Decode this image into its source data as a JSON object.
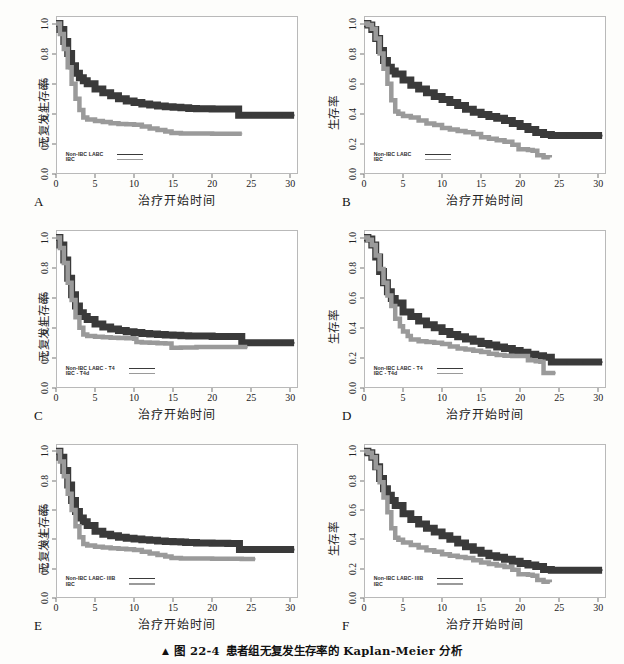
{
  "caption": {
    "marker": "▲",
    "figure_number": "图 22-4",
    "text": "患者组无复发生存率的 Kaplan-Meier 分析"
  },
  "axes": {
    "xlabel": "治疗开始时间",
    "ylabel_rfs": "无复发生存率",
    "ylabel_os": "生存率",
    "xticks": [
      "0",
      "5",
      "10",
      "15",
      "20",
      "25",
      "30"
    ],
    "yticks": [
      "0.0",
      "0.2",
      "0.4",
      "0.6",
      "0.8",
      "1.0"
    ],
    "xlim": [
      0,
      31
    ],
    "ylim": [
      0,
      1.05
    ]
  },
  "colors": {
    "series_dark": "#3a3a3a",
    "series_light": "#9a9a9a",
    "axis": "#b9b9b9",
    "background": "#ffffff",
    "page": "#fdfdfb"
  },
  "chart_data": [
    {
      "type": "line",
      "panel": "A",
      "title": "",
      "xlabel": "治疗开始时间",
      "ylabel": "无复发生存率",
      "xlim": [
        0,
        31
      ],
      "ylim": [
        0,
        1.05
      ],
      "grid": false,
      "legend_position": "bottom-left",
      "series": [
        {
          "name": "Non-IBC LABC",
          "style": "dark",
          "x": [
            0,
            0.5,
            1,
            1.5,
            2,
            2.5,
            3,
            3.5,
            4,
            5,
            6,
            7,
            8,
            9,
            10,
            11,
            12,
            13,
            14,
            15,
            16,
            17,
            18,
            19,
            20,
            21,
            22,
            23,
            23.4,
            25,
            27,
            29,
            30.5
          ],
          "y": [
            1.0,
            0.96,
            0.88,
            0.8,
            0.72,
            0.67,
            0.64,
            0.62,
            0.6,
            0.565,
            0.54,
            0.52,
            0.5,
            0.485,
            0.475,
            0.465,
            0.458,
            0.452,
            0.447,
            0.443,
            0.44,
            0.436,
            0.434,
            0.433,
            0.432,
            0.432,
            0.432,
            0.432,
            0.39,
            0.39,
            0.39,
            0.39,
            0.39
          ]
        },
        {
          "name": "IBC",
          "style": "light",
          "x": [
            0,
            0.5,
            1,
            1.5,
            2,
            2.5,
            3,
            3.5,
            4,
            5,
            6,
            7,
            8,
            9,
            10,
            11,
            12,
            13,
            14,
            14.8,
            16,
            18,
            20,
            22,
            23.8
          ],
          "y": [
            1.0,
            0.93,
            0.83,
            0.71,
            0.6,
            0.5,
            0.425,
            0.375,
            0.362,
            0.352,
            0.345,
            0.338,
            0.333,
            0.33,
            0.327,
            0.315,
            0.302,
            0.292,
            0.282,
            0.272,
            0.27,
            0.269,
            0.268,
            0.268,
            0.268
          ]
        }
      ],
      "legend": [
        "Non-IBC LABC",
        "IBC"
      ]
    },
    {
      "type": "line",
      "panel": "B",
      "title": "",
      "xlabel": "治疗开始时间",
      "ylabel": "生存率",
      "xlim": [
        0,
        31
      ],
      "ylim": [
        0,
        1.05
      ],
      "grid": false,
      "legend_position": "bottom-left",
      "series": [
        {
          "name": "Non-IBC LABC",
          "style": "dark",
          "x": [
            0,
            0.5,
            1,
            1.5,
            2,
            2.5,
            3,
            3.5,
            4,
            5,
            6,
            7,
            8,
            9,
            10,
            11,
            12,
            13,
            14,
            15,
            16,
            17,
            18,
            19,
            20,
            21,
            22,
            23,
            24,
            26,
            28,
            30.5
          ],
          "y": [
            1.0,
            0.99,
            0.96,
            0.9,
            0.82,
            0.755,
            0.71,
            0.685,
            0.665,
            0.625,
            0.59,
            0.565,
            0.54,
            0.515,
            0.495,
            0.475,
            0.455,
            0.43,
            0.41,
            0.395,
            0.382,
            0.37,
            0.355,
            0.335,
            0.315,
            0.295,
            0.275,
            0.262,
            0.255,
            0.255,
            0.255,
            0.255
          ]
        },
        {
          "name": "IBC",
          "style": "light",
          "x": [
            0,
            0.5,
            1,
            1.5,
            2,
            2.5,
            3,
            3.5,
            4,
            4.4,
            5,
            6,
            7,
            8,
            9,
            10,
            11,
            12,
            13,
            14,
            15,
            16,
            17,
            18,
            19,
            19.8,
            21,
            21.6,
            22.2,
            23,
            23.8
          ],
          "y": [
            1.0,
            0.99,
            0.965,
            0.9,
            0.8,
            0.7,
            0.6,
            0.49,
            0.415,
            0.4,
            0.385,
            0.375,
            0.355,
            0.335,
            0.325,
            0.305,
            0.295,
            0.285,
            0.278,
            0.265,
            0.245,
            0.235,
            0.225,
            0.215,
            0.195,
            0.165,
            0.16,
            0.155,
            0.125,
            0.112,
            0.11
          ]
        }
      ],
      "legend": [
        "Non-IBC LABC",
        "IBC"
      ]
    },
    {
      "type": "line",
      "panel": "C",
      "title": "",
      "xlabel": "治疗开始时间",
      "ylabel": "无复发生存率",
      "xlim": [
        0,
        31
      ],
      "ylim": [
        0,
        1.05
      ],
      "grid": false,
      "legend_position": "bottom-left",
      "series": [
        {
          "name": "Non-IBC LABC - T4",
          "style": "dark",
          "x": [
            0,
            0.5,
            1,
            1.5,
            2,
            2.5,
            3,
            3.5,
            4,
            5,
            6,
            7,
            8,
            9,
            10,
            11,
            12,
            13,
            14,
            15,
            16,
            17,
            18,
            20,
            22,
            23.8,
            25,
            27,
            29,
            30.5
          ],
          "y": [
            1.0,
            0.95,
            0.85,
            0.73,
            0.62,
            0.545,
            0.5,
            0.475,
            0.455,
            0.425,
            0.405,
            0.392,
            0.382,
            0.374,
            0.368,
            0.363,
            0.358,
            0.355,
            0.352,
            0.35,
            0.348,
            0.346,
            0.345,
            0.343,
            0.342,
            0.3,
            0.3,
            0.3,
            0.3,
            0.3
          ]
        },
        {
          "name": "IBC - T4d",
          "style": "light",
          "x": [
            0,
            0.5,
            1,
            1.5,
            2,
            2.5,
            3,
            3.5,
            4,
            5,
            6,
            7,
            8,
            9,
            10,
            10.3,
            11,
            12,
            13,
            14,
            14.8,
            16,
            18,
            20,
            22,
            24.5
          ],
          "y": [
            1.0,
            0.93,
            0.83,
            0.7,
            0.585,
            0.47,
            0.4,
            0.355,
            0.345,
            0.34,
            0.337,
            0.334,
            0.332,
            0.33,
            0.328,
            0.305,
            0.302,
            0.3,
            0.298,
            0.295,
            0.268,
            0.27,
            0.272,
            0.272,
            0.272,
            0.272
          ]
        }
      ],
      "legend": [
        "Non-IBC LABC - T4",
        "IBC - T4d"
      ]
    },
    {
      "type": "line",
      "panel": "D",
      "title": "",
      "xlabel": "治疗开始时间",
      "ylabel": "生存率",
      "xlim": [
        0,
        31
      ],
      "ylim": [
        0,
        1.05
      ],
      "grid": false,
      "legend_position": "bottom-left",
      "series": [
        {
          "name": "Non-IBC LABC - T4",
          "style": "dark",
          "x": [
            0,
            0.5,
            1,
            1.5,
            2,
            2.5,
            3,
            3.5,
            4,
            5,
            6,
            7,
            8,
            9,
            10,
            11,
            12,
            13,
            14,
            15,
            16,
            17,
            18,
            19,
            20,
            21,
            22,
            23,
            24,
            26,
            28,
            30.5
          ],
          "y": [
            1.0,
            0.99,
            0.95,
            0.87,
            0.775,
            0.7,
            0.64,
            0.595,
            0.565,
            0.505,
            0.475,
            0.445,
            0.42,
            0.4,
            0.375,
            0.355,
            0.34,
            0.325,
            0.31,
            0.295,
            0.285,
            0.272,
            0.262,
            0.25,
            0.238,
            0.225,
            0.215,
            0.205,
            0.172,
            0.172,
            0.172,
            0.172
          ]
        },
        {
          "name": "IBC - T4d",
          "style": "light",
          "x": [
            0,
            0.5,
            1,
            1.5,
            2,
            2.5,
            3,
            3.5,
            4,
            4.6,
            5,
            5.6,
            6,
            7,
            8,
            9,
            10,
            11,
            12,
            13,
            14,
            15,
            16,
            17,
            18,
            19,
            19.8,
            21,
            22,
            22.6,
            23,
            24.5
          ],
          "y": [
            1.0,
            0.985,
            0.95,
            0.88,
            0.79,
            0.7,
            0.615,
            0.545,
            0.46,
            0.41,
            0.375,
            0.345,
            0.322,
            0.31,
            0.305,
            0.3,
            0.292,
            0.275,
            0.262,
            0.255,
            0.248,
            0.24,
            0.228,
            0.22,
            0.215,
            0.212,
            0.212,
            0.185,
            0.178,
            0.175,
            0.1,
            0.1
          ]
        }
      ],
      "legend": [
        "Non-IBC LABC - T4",
        "IBC - T4d"
      ]
    },
    {
      "type": "line",
      "panel": "E",
      "title": "",
      "xlabel": "治疗开始时间",
      "ylabel": "无复发生存率",
      "xlim": [
        0,
        31
      ],
      "ylim": [
        0,
        1.05
      ],
      "grid": false,
      "legend_position": "bottom-left",
      "series": [
        {
          "name": "Non-IBC LABC- IIIB",
          "style": "dark",
          "x": [
            0,
            0.5,
            1,
            1.5,
            2,
            2.5,
            3,
            3.5,
            4,
            5,
            6,
            7,
            8,
            9,
            10,
            11,
            12,
            13,
            14,
            15,
            16,
            16.6,
            18,
            20,
            22,
            23.5,
            25,
            27,
            29,
            30.5
          ],
          "y": [
            1.0,
            0.96,
            0.87,
            0.77,
            0.665,
            0.59,
            0.545,
            0.52,
            0.495,
            0.455,
            0.435,
            0.425,
            0.415,
            0.408,
            0.402,
            0.398,
            0.393,
            0.389,
            0.386,
            0.383,
            0.381,
            0.378,
            0.375,
            0.373,
            0.372,
            0.33,
            0.33,
            0.33,
            0.33,
            0.33
          ]
        },
        {
          "name": "IBC",
          "style": "light",
          "x": [
            0,
            0.5,
            1,
            1.5,
            2,
            2.5,
            3,
            3.5,
            4,
            5,
            6,
            7,
            8,
            9,
            10,
            11,
            12,
            13,
            14,
            14.8,
            16,
            18,
            20,
            22,
            23.8,
            25.5
          ],
          "y": [
            1.0,
            0.93,
            0.83,
            0.71,
            0.6,
            0.49,
            0.415,
            0.368,
            0.358,
            0.35,
            0.345,
            0.34,
            0.336,
            0.332,
            0.328,
            0.315,
            0.303,
            0.293,
            0.283,
            0.272,
            0.27,
            0.269,
            0.268,
            0.268,
            0.266,
            0.266
          ]
        }
      ],
      "legend": [
        "Non-IBC LABC- IIIB",
        "IBC"
      ]
    },
    {
      "type": "line",
      "panel": "F",
      "title": "",
      "xlabel": "治疗开始时间",
      "ylabel": "生存率",
      "xlim": [
        0,
        31
      ],
      "ylim": [
        0,
        1.05
      ],
      "grid": false,
      "legend_position": "bottom-left",
      "series": [
        {
          "name": "Non-IBC LABC- IIIB",
          "style": "dark",
          "x": [
            0,
            0.5,
            1,
            1.5,
            2,
            2.5,
            3,
            3.5,
            4,
            5,
            6,
            7,
            8,
            9,
            10,
            11,
            12,
            13,
            14,
            15,
            16,
            17,
            18,
            19,
            20,
            21,
            22,
            23,
            24,
            26,
            28,
            30.5
          ],
          "y": [
            1.0,
            0.99,
            0.96,
            0.895,
            0.815,
            0.745,
            0.7,
            0.665,
            0.63,
            0.575,
            0.535,
            0.505,
            0.475,
            0.45,
            0.425,
            0.4,
            0.375,
            0.35,
            0.325,
            0.305,
            0.288,
            0.278,
            0.265,
            0.25,
            0.235,
            0.225,
            0.215,
            0.195,
            0.19,
            0.19,
            0.19,
            0.19
          ]
        },
        {
          "name": "IBC",
          "style": "light",
          "x": [
            0,
            0.5,
            1,
            1.5,
            2,
            2.5,
            3,
            3.5,
            4,
            4.4,
            5,
            6,
            7,
            8,
            9,
            10,
            11,
            12,
            13,
            14,
            15,
            16,
            17,
            18,
            19,
            19.8,
            21,
            21.6,
            22.2,
            23,
            23.8
          ],
          "y": [
            1.0,
            0.99,
            0.96,
            0.89,
            0.79,
            0.685,
            0.585,
            0.475,
            0.41,
            0.398,
            0.378,
            0.362,
            0.345,
            0.325,
            0.315,
            0.298,
            0.288,
            0.28,
            0.272,
            0.258,
            0.242,
            0.232,
            0.222,
            0.212,
            0.192,
            0.162,
            0.158,
            0.152,
            0.122,
            0.11,
            0.108
          ]
        }
      ],
      "legend": [
        "Non-IBC LABC- IIIB",
        "IBC"
      ]
    }
  ],
  "panels": [
    {
      "letter": "A"
    },
    {
      "letter": "B"
    },
    {
      "letter": "C"
    },
    {
      "letter": "D"
    },
    {
      "letter": "E"
    },
    {
      "letter": "F"
    }
  ]
}
